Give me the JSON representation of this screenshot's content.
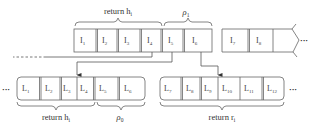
{
  "top_row": {
    "cells": [
      "I",
      "I",
      "I",
      "I",
      "I",
      "I"
    ],
    "subs": [
      "1",
      "2",
      "3",
      "4",
      "5",
      "6"
    ],
    "braces": [
      {
        "label": "return h",
        "sub": "i"
      },
      {
        "label": "ρ",
        "sub": "1"
      }
    ]
  },
  "top_right_row": {
    "cells": [
      "I",
      "I"
    ],
    "subs": [
      "7",
      "8"
    ],
    "ellipsis": "···"
  },
  "bottom_left_row": {
    "ellipsis": "···",
    "cells": [
      "L",
      "L",
      "L",
      "L",
      "L",
      "L"
    ],
    "subs": [
      "1",
      "2",
      "3",
      "4",
      "5",
      "6"
    ],
    "braces": [
      {
        "label": "return h",
        "sub": "i"
      },
      {
        "label": "ρ",
        "sub": "0"
      }
    ]
  },
  "bottom_right_row": {
    "cells": [
      "L",
      "L",
      "L",
      "L",
      "L",
      "L"
    ],
    "subs": [
      "7",
      "8",
      "9",
      "10",
      "11",
      "12"
    ],
    "ellipsis": "···",
    "braces": [
      {
        "label": "return r",
        "sub": "i"
      }
    ]
  },
  "colors": {
    "stroke": "#555555",
    "text": "#333333",
    "background": "#ffffff"
  }
}
